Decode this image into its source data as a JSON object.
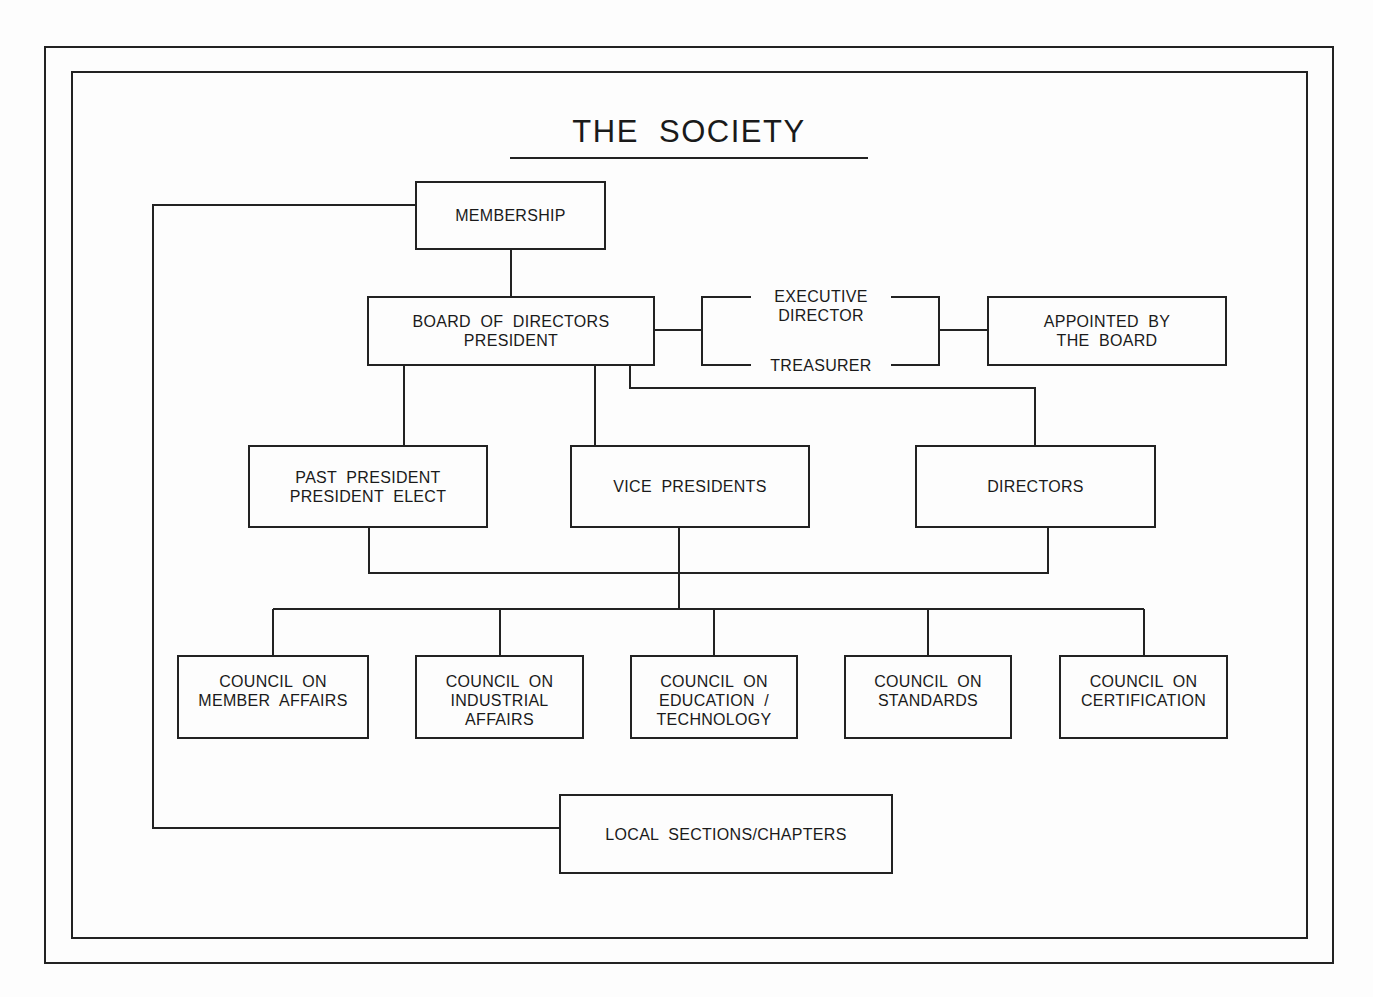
{
  "diagram": {
    "title": "THE  SOCIETY",
    "nodes": {
      "membership": {
        "lines": [
          "MEMBERSHIP"
        ]
      },
      "board": {
        "lines": [
          "BOARD  OF  DIRECTORS",
          "PRESIDENT"
        ]
      },
      "executive": {
        "lines": [
          "EXECUTIVE",
          "DIRECTOR"
        ]
      },
      "treasurer": {
        "lines": [
          "TREASURER"
        ]
      },
      "appointed": {
        "lines": [
          "APPOINTED  BY",
          "THE  BOARD"
        ]
      },
      "past_president": {
        "lines": [
          "PAST  PRESIDENT",
          "PRESIDENT  ELECT"
        ]
      },
      "vice_presidents": {
        "lines": [
          "VICE  PRESIDENTS"
        ]
      },
      "directors": {
        "lines": [
          "DIRECTORS"
        ]
      },
      "council_member": {
        "lines": [
          "COUNCIL  ON",
          "MEMBER  AFFAIRS"
        ]
      },
      "council_industrial": {
        "lines": [
          "COUNCIL  ON",
          "INDUSTRIAL",
          "AFFAIRS"
        ]
      },
      "council_education": {
        "lines": [
          "COUNCIL  ON",
          "EDUCATION  /",
          "TECHNOLOGY"
        ]
      },
      "council_standards": {
        "lines": [
          "COUNCIL  ON",
          "STANDARDS"
        ]
      },
      "council_certification": {
        "lines": [
          "COUNCIL  ON",
          "CERTIFICATION"
        ]
      },
      "local_sections": {
        "lines": [
          "LOCAL  SECTIONS/CHAPTERS"
        ]
      }
    },
    "edges": [
      [
        "membership",
        "board"
      ],
      [
        "board",
        "executive"
      ],
      [
        "board",
        "treasurer"
      ],
      [
        "executive",
        "appointed"
      ],
      [
        "treasurer",
        "appointed"
      ],
      [
        "board",
        "past_president"
      ],
      [
        "board",
        "vice_presidents"
      ],
      [
        "board",
        "directors"
      ],
      [
        "past_president",
        "council_bus"
      ],
      [
        "vice_presidents",
        "council_bus"
      ],
      [
        "directors",
        "council_bus"
      ],
      [
        "council_bus",
        "council_member"
      ],
      [
        "council_bus",
        "council_industrial"
      ],
      [
        "council_bus",
        "council_education"
      ],
      [
        "council_bus",
        "council_standards"
      ],
      [
        "council_bus",
        "council_certification"
      ],
      [
        "membership",
        "local_sections"
      ]
    ]
  }
}
